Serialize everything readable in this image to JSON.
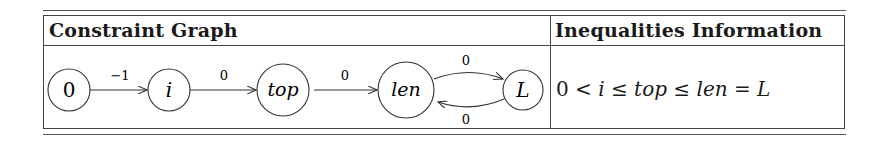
{
  "table": {
    "headers": [
      "Constraint Graph",
      "Inequalities Information"
    ],
    "graph": {
      "nodes": [
        {
          "id": "0",
          "label": "0",
          "italic": false
        },
        {
          "id": "i",
          "label": "i",
          "italic": true
        },
        {
          "id": "top",
          "label": "top",
          "italic": true
        },
        {
          "id": "len",
          "label": "len",
          "italic": true
        },
        {
          "id": "L",
          "label": "L",
          "italic": true
        }
      ],
      "edges": [
        {
          "from": "0",
          "to": "i",
          "weight": "−1"
        },
        {
          "from": "i",
          "to": "top",
          "weight": "0"
        },
        {
          "from": "top",
          "to": "len",
          "weight": "0"
        },
        {
          "from": "len",
          "to": "L",
          "weight": "0"
        },
        {
          "from": "L",
          "to": "len",
          "weight": "0"
        }
      ]
    },
    "inequality": {
      "tokens": [
        "0",
        "<",
        "i",
        "≤",
        "top",
        "≤",
        "len",
        "=",
        "L"
      ],
      "text": "0 < i ≤ top ≤ len = L"
    }
  }
}
